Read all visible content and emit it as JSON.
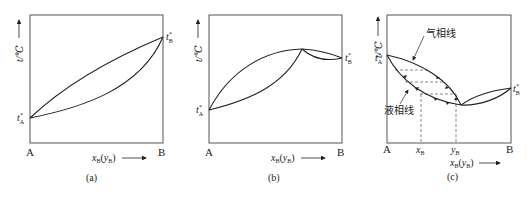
{
  "figure": {
    "panels": [
      {
        "id": "a",
        "caption": "(a)",
        "y_axis_label": "t/℃",
        "x_axis_label_main": "x",
        "x_axis_label_sub": "B",
        "x_axis_label_paren_main": "y",
        "x_axis_label_paren_sub": "B",
        "left_label": "A",
        "right_label": "B",
        "tA_label": "t",
        "tA_sup": "*",
        "tA_sub": "A",
        "tB_label": "t",
        "tB_sup": "*",
        "tB_sub": "B"
      },
      {
        "id": "b",
        "caption": "(b)",
        "y_axis_label": "t/℃",
        "x_axis_label_main": "x",
        "x_axis_label_sub": "B",
        "x_axis_label_paren_main": "y",
        "x_axis_label_paren_sub": "B",
        "left_label": "A",
        "right_label": "B",
        "tA_label": "t",
        "tA_sup": "*",
        "tA_sub": "A",
        "tB_label": "t",
        "tB_sup": "*",
        "tB_sub": "B"
      },
      {
        "id": "c",
        "caption": "(c)",
        "y_axis_label": "t/℃",
        "x_axis_label_main": "x",
        "x_axis_label_sub": "B",
        "x_axis_label_paren_main": "y",
        "x_axis_label_paren_sub": "B",
        "left_label": "A",
        "right_label": "B",
        "xB_tick_main": "x",
        "xB_tick_sub": "B",
        "yB_tick_main": "y",
        "yB_tick_sub": "B",
        "tA_label": "t",
        "tA_sup": "*",
        "tA_sub": "A",
        "tB_label": "t",
        "tB_sup": "*",
        "tB_sub": "B",
        "vapor_line_label": "气相线",
        "liquid_line_label": "液相线"
      }
    ]
  }
}
